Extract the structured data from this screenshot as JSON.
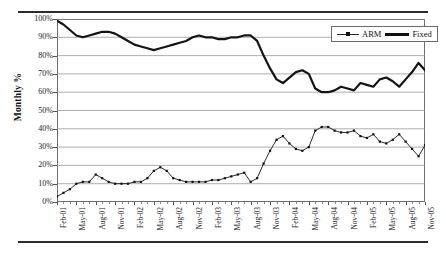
{
  "figure": {
    "y_axis_title": "Monthly %",
    "rule_top": "horizontal-rule",
    "rule_bottom": "horizontal-rule"
  },
  "legend": {
    "position": "top-right-inside",
    "entries": [
      {
        "name": "ARM",
        "marker": "square",
        "style": "thin-line-with-markers",
        "color": "#111111"
      },
      {
        "name": "Fixed",
        "marker": "none",
        "style": "thick-line",
        "color": "#111111"
      }
    ]
  },
  "chart_data": {
    "type": "line",
    "title": "",
    "subtitle": "",
    "xlabel": "",
    "ylabel": "Monthly %",
    "ylim": [
      0,
      100
    ],
    "yticks": [
      0,
      10,
      20,
      30,
      40,
      50,
      60,
      70,
      80,
      90,
      100
    ],
    "ytick_labels": [
      "0%",
      "10%",
      "20%",
      "30%",
      "40%",
      "50%",
      "60%",
      "70%",
      "80%",
      "90%",
      "100%"
    ],
    "grid": "horizontal-only",
    "legend_position": "upper right",
    "x_tick_labels": [
      "Feb-01",
      "May-01",
      "Aug-01",
      "Nov-01",
      "Feb-02",
      "May-02",
      "Aug-02",
      "Nov-02",
      "Feb-03",
      "May-03",
      "Aug-03",
      "Nov-03",
      "Feb-04",
      "May-04",
      "Aug-04",
      "Nov-04",
      "Feb-05",
      "May-05",
      "Aug-05",
      "Nov-05"
    ],
    "x_tick_every": 3,
    "x": [
      "Feb-01",
      "Mar-01",
      "Apr-01",
      "May-01",
      "Jun-01",
      "Jul-01",
      "Aug-01",
      "Sep-01",
      "Oct-01",
      "Nov-01",
      "Dec-01",
      "Jan-02",
      "Feb-02",
      "Mar-02",
      "Apr-02",
      "May-02",
      "Jun-02",
      "Jul-02",
      "Aug-02",
      "Sep-02",
      "Oct-02",
      "Nov-02",
      "Dec-02",
      "Jan-03",
      "Feb-03",
      "Mar-03",
      "Apr-03",
      "May-03",
      "Jun-03",
      "Jul-03",
      "Aug-03",
      "Sep-03",
      "Oct-03",
      "Nov-03",
      "Dec-03",
      "Jan-04",
      "Feb-04",
      "Mar-04",
      "Apr-04",
      "May-04",
      "Jun-04",
      "Jul-04",
      "Aug-04",
      "Sep-04",
      "Oct-04",
      "Nov-04",
      "Dec-04",
      "Jan-05",
      "Feb-05",
      "Mar-05",
      "Apr-05",
      "May-05",
      "Jun-05",
      "Jul-05",
      "Aug-05",
      "Sep-05",
      "Oct-05",
      "Nov-05"
    ],
    "series": [
      {
        "name": "Fixed",
        "values": [
          99,
          97,
          94,
          91,
          90,
          91,
          92,
          93,
          93,
          92,
          90,
          88,
          86,
          85,
          84,
          83,
          84,
          85,
          86,
          87,
          88,
          90,
          91,
          90,
          90,
          89,
          89,
          90,
          90,
          91,
          91,
          88,
          80,
          73,
          67,
          65,
          68,
          71,
          72,
          70,
          62,
          60,
          60,
          61,
          63,
          62,
          61,
          65,
          64,
          63,
          67,
          68,
          66,
          63,
          67,
          71,
          76,
          72
        ]
      },
      {
        "name": "ARM",
        "values": [
          3,
          5,
          7,
          10,
          11,
          11,
          15,
          13,
          11,
          10,
          10,
          10,
          11,
          11,
          13,
          17,
          19,
          17,
          13,
          12,
          11,
          11,
          11,
          11,
          12,
          12,
          13,
          14,
          15,
          16,
          11,
          13,
          21,
          28,
          34,
          36,
          32,
          29,
          28,
          30,
          39,
          41,
          41,
          39,
          38,
          38,
          39,
          36,
          35,
          37,
          33,
          32,
          34,
          37,
          33,
          29,
          25,
          31
        ]
      }
    ]
  }
}
